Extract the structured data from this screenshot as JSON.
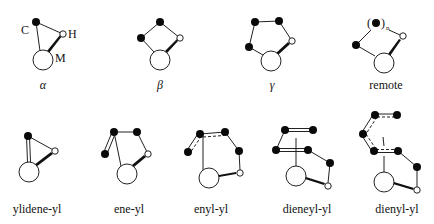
{
  "diagram": {
    "atom_labels": {
      "carbon": "C",
      "hydrogen": "H",
      "metal": "M",
      "repeat_open": "(",
      "repeat_close": ")",
      "repeat_n": "n"
    },
    "top_row": [
      {
        "id": "alpha",
        "caption": "α"
      },
      {
        "id": "beta",
        "caption": "β"
      },
      {
        "id": "gamma",
        "caption": "γ"
      },
      {
        "id": "remote",
        "caption": "remote"
      }
    ],
    "bottom_row": [
      {
        "id": "ylidene-yl",
        "caption": "ylidene-yl"
      },
      {
        "id": "ene-yl",
        "caption": "ene-yl"
      },
      {
        "id": "enyl-yl",
        "caption": "enyl-yl"
      },
      {
        "id": "dieneyl-yl",
        "caption": "dieneyl-yl"
      },
      {
        "id": "dienyl-yl",
        "caption": "dienyl-yl"
      }
    ],
    "legend": {
      "filled_circle": "carbon",
      "small_open_circle": "hydrogen",
      "large_open_circle": "metal",
      "wedge": "agostic M···H interaction"
    }
  }
}
